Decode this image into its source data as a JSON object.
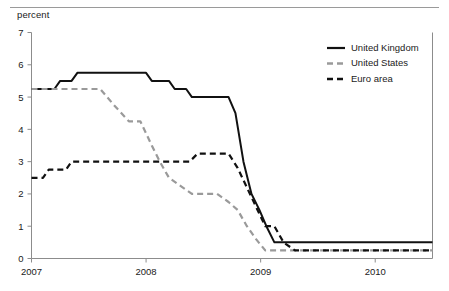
{
  "axis_unit_label": "percent",
  "chart_data": {
    "type": "line",
    "title": "",
    "subtitle": "",
    "xlabel": "",
    "ylabel": "percent",
    "xlim": [
      2007.0,
      2010.5
    ],
    "ylim": [
      0,
      7
    ],
    "yticks": [
      0,
      1,
      2,
      3,
      4,
      5,
      6,
      7
    ],
    "ytick_labels": [
      "0",
      "1",
      "2",
      "3",
      "4",
      "5",
      "6",
      "7"
    ],
    "xticks": [
      2007,
      2008,
      2009,
      2010
    ],
    "xtick_labels": [
      "2007",
      "2008",
      "2009",
      "2010"
    ],
    "grid": false,
    "legend_position": "top-right",
    "series": [
      {
        "name": "United Kingdom",
        "style": "solid",
        "color": "#111111",
        "x": [
          2007.0,
          2007.2,
          2007.25,
          2007.35,
          2007.4,
          2007.55,
          2007.6,
          2008.0,
          2008.05,
          2008.2,
          2008.25,
          2008.35,
          2008.4,
          2008.72,
          2008.78,
          2008.85,
          2008.92,
          2008.99,
          2009.05,
          2009.12,
          2009.2,
          2009.28,
          2010.5
        ],
        "y": [
          5.25,
          5.25,
          5.5,
          5.5,
          5.75,
          5.75,
          5.75,
          5.75,
          5.5,
          5.5,
          5.25,
          5.25,
          5.0,
          5.0,
          4.5,
          3.0,
          2.0,
          1.5,
          1.0,
          0.5,
          0.5,
          0.5,
          0.5
        ]
      },
      {
        "name": "United States",
        "style": "dashed",
        "color": "#9a9a9a",
        "x": [
          2007.0,
          2007.25,
          2007.6,
          2007.72,
          2007.85,
          2007.95,
          2008.05,
          2008.12,
          2008.2,
          2008.3,
          2008.4,
          2008.62,
          2008.72,
          2008.8,
          2008.88,
          2008.96,
          2009.04,
          2009.12,
          2010.5
        ],
        "y": [
          5.25,
          5.25,
          5.25,
          4.75,
          4.25,
          4.25,
          3.5,
          3.0,
          2.5,
          2.25,
          2.0,
          2.0,
          1.75,
          1.5,
          1.0,
          0.6,
          0.25,
          0.25,
          0.25
        ]
      },
      {
        "name": "Euro area",
        "style": "dashed",
        "color": "#111111",
        "x": [
          2007.0,
          2007.1,
          2007.15,
          2007.3,
          2007.35,
          2008.38,
          2008.45,
          2008.52,
          2008.72,
          2008.8,
          2008.88,
          2008.96,
          2009.04,
          2009.12,
          2009.2,
          2009.3,
          2010.5
        ],
        "y": [
          2.5,
          2.5,
          2.75,
          2.75,
          3.0,
          3.0,
          3.25,
          3.25,
          3.25,
          2.8,
          2.2,
          1.6,
          1.0,
          1.0,
          0.5,
          0.25,
          0.25
        ]
      }
    ]
  },
  "legend": {
    "entries": [
      {
        "label": "United Kingdom",
        "style": "solid",
        "color": "#111111"
      },
      {
        "label": "United States",
        "style": "dashed",
        "color": "#9a9a9a"
      },
      {
        "label": "Euro area",
        "style": "dashed",
        "color": "#111111"
      }
    ]
  }
}
